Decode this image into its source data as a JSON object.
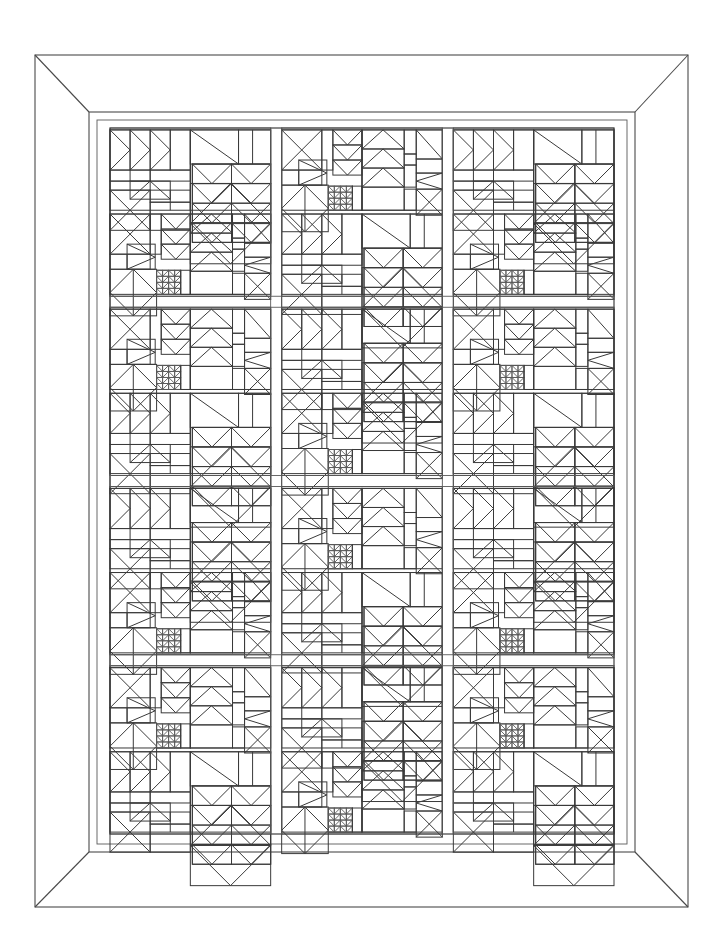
{
  "artwork": {
    "title": "Quilt Block Sampler Line Drawing",
    "kind": "line-art",
    "description": "Black-and-white outline drawing of a patchwork quilt with a mitered border",
    "line_color": "#3a3a3a",
    "background_color": "#ffffff",
    "canvas": {
      "width": 722,
      "height": 943
    }
  },
  "frame": {
    "outer": {
      "x": 35,
      "y": 55,
      "width": 653,
      "height": 852
    },
    "inner": {
      "x": 89,
      "y": 112,
      "width": 546,
      "height": 740
    },
    "miter_corners": 4,
    "border_width": 54,
    "label": "mitered-quilt-border"
  },
  "field": {
    "x": 110,
    "y": 128,
    "width": 504,
    "height": 706,
    "columns": 3,
    "rows": 4,
    "block_width": 168,
    "block_height": 176.5,
    "sashing_width": 11,
    "sub_blocks_per_block": 4
  },
  "block_grid": {
    "pattern_names": [
      "A",
      "B"
    ],
    "layout": [
      [
        "A",
        "B",
        "A"
      ],
      [
        "B",
        "A",
        "B"
      ],
      [
        "A",
        "B",
        "A"
      ],
      [
        "B",
        "A",
        "B"
      ]
    ]
  },
  "patterns": {
    "A": {
      "name": "flying-geese-and-diamond",
      "sub_blocks": [
        "flying-geese-corner",
        "pinwheel-star-diamond",
        "hourglass-cross",
        "diamond-in-square"
      ]
    },
    "B": {
      "name": "broken-dishes-and-sawtooth",
      "sub_blocks": [
        "hourglass-x",
        "chevron-stack",
        "square-diamond",
        "sawtooth-star"
      ]
    }
  },
  "chart_data": {
    "type": "table",
    "categories": [
      "Row 1",
      "Row 2",
      "Row 3",
      "Row 4"
    ],
    "series": [
      {
        "name": "Column 1",
        "values": [
          "A",
          "B",
          "A",
          "B"
        ]
      },
      {
        "name": "Column 2",
        "values": [
          "B",
          "A",
          "B",
          "A"
        ]
      },
      {
        "name": "Column 3",
        "values": [
          "A",
          "B",
          "A",
          "B"
        ]
      }
    ],
    "xlabel": "Column",
    "ylabel": "Row",
    "grid": true,
    "legend": "none"
  }
}
